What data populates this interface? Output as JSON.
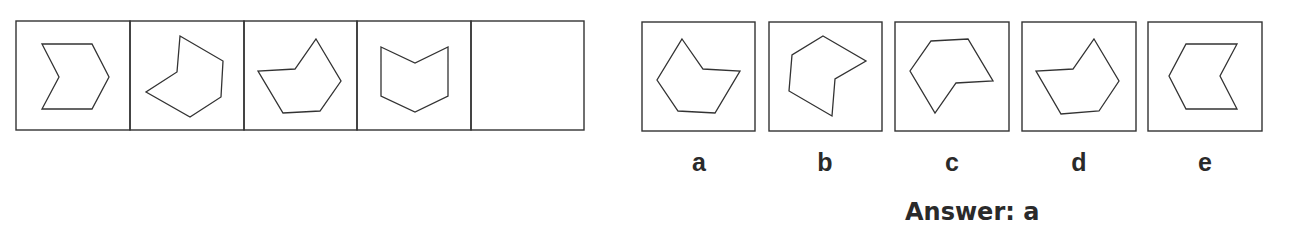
{
  "colors": {
    "stroke": "#333333",
    "text": "#2a2a2a",
    "background": "#ffffff"
  },
  "sequence": {
    "boxes": [
      {
        "x": 16,
        "y": 21,
        "w": 114,
        "h": 109,
        "points": "42,44 92,44 109,77 92,109 42,109 59,77"
      },
      {
        "x": 130,
        "y": 21,
        "w": 114,
        "h": 109,
        "points": "180,36 223,61 221,97 190,117 146,92 177,72"
      },
      {
        "x": 244,
        "y": 21,
        "w": 113,
        "h": 109,
        "points": "316,39 341,81 320,111 283,113 258,71 295,69"
      },
      {
        "x": 357,
        "y": 21,
        "w": 114,
        "h": 109,
        "points": "381,47 415,63 448,47 448,96 415,112 381,96"
      },
      {
        "x": 471,
        "y": 21,
        "w": 113,
        "h": 109,
        "points": ""
      }
    ]
  },
  "options": [
    {
      "label": "a",
      "x": 642,
      "y": 22,
      "w": 113,
      "h": 109,
      "points": "682,39 703,69 740,71 715,113 678,111 657,80"
    },
    {
      "label": "b",
      "x": 769,
      "y": 22,
      "w": 113,
      "h": 109,
      "points": "823,36 866,61 835,79 832,116 789,91 792,55"
    },
    {
      "label": "c",
      "x": 895,
      "y": 22,
      "w": 114,
      "h": 109,
      "points": "931,41 968,39 993,81 956,83 935,113 910,71"
    },
    {
      "label": "d",
      "x": 1022,
      "y": 22,
      "w": 114,
      "h": 109,
      "points": "1094,39 1119,81 1099,111 1061,114 1036,71 1073,69"
    },
    {
      "label": "e",
      "x": 1148,
      "y": 22,
      "w": 114,
      "h": 109,
      "points": "1186,44 1237,44 1220,76 1237,109 1186,109 1169,76"
    }
  ],
  "answer_text": "Answer: a"
}
